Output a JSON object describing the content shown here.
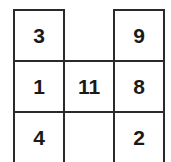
{
  "grid": {
    "left": [
      "3",
      "1",
      "4"
    ],
    "center": "11",
    "right": [
      "9",
      "8",
      "2"
    ]
  }
}
